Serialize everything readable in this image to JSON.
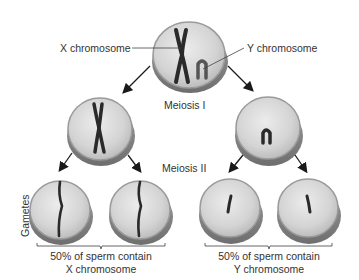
{
  "diagram": {
    "labels": {
      "x_chromosome": "X chromosome",
      "y_chromosome": "Y chromosome",
      "meiosis_1": "Meiosis I",
      "meiosis_2": "Meiosis II",
      "gametes": "Gametes"
    },
    "captions": {
      "left_line1": "50% of sperm contain",
      "left_line2": "X chromosome",
      "right_line1": "50% of sperm contain",
      "right_line2": "Y chromosome"
    },
    "colors": {
      "cell_fill": "#d8d8d8",
      "cell_rim": "#8a8a8a",
      "chromosome": "#2a2a2a",
      "arrow": "#1a1a1a",
      "text": "#333333"
    },
    "cells": [
      {
        "id": "parent",
        "stage": "start",
        "contains": [
          "X",
          "Y"
        ]
      },
      {
        "id": "meiosis1-left",
        "stage": "after Meiosis I",
        "contains": [
          "X"
        ]
      },
      {
        "id": "meiosis1-right",
        "stage": "after Meiosis I",
        "contains": [
          "Y"
        ]
      },
      {
        "id": "gamete-1",
        "stage": "gamete",
        "contains": [
          "X"
        ]
      },
      {
        "id": "gamete-2",
        "stage": "gamete",
        "contains": [
          "X"
        ]
      },
      {
        "id": "gamete-3",
        "stage": "gamete",
        "contains": [
          "Y"
        ]
      },
      {
        "id": "gamete-4",
        "stage": "gamete",
        "contains": [
          "Y"
        ]
      }
    ]
  }
}
